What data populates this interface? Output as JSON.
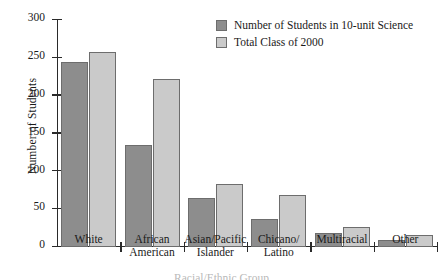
{
  "chart_data": {
    "type": "bar",
    "title": "",
    "xlabel": "Racial/Ethnic Group",
    "ylabel": "Number of Students",
    "ylim": [
      0,
      300
    ],
    "yticks": [
      0,
      50,
      100,
      150,
      200,
      250,
      300
    ],
    "grid": false,
    "legend_position": "top-right",
    "categories": [
      "White",
      "African\nAmerican",
      "Asian/Pacific\nIslander",
      "Chicano/\nLatino",
      "Multiracial",
      "Other"
    ],
    "series": [
      {
        "name": "Number of Students in 10-unit Science",
        "color": "#8d8d8d",
        "values": [
          245,
          135,
          65,
          37,
          18,
          9
        ]
      },
      {
        "name": "Total Class of 2000",
        "color": "#cacaca",
        "values": [
          258,
          222,
          83,
          69,
          26,
          16
        ]
      }
    ]
  },
  "legend": {
    "items": [
      {
        "label": "Number of Students in 10-unit Science"
      },
      {
        "label": "Total Class of 2000"
      }
    ]
  }
}
